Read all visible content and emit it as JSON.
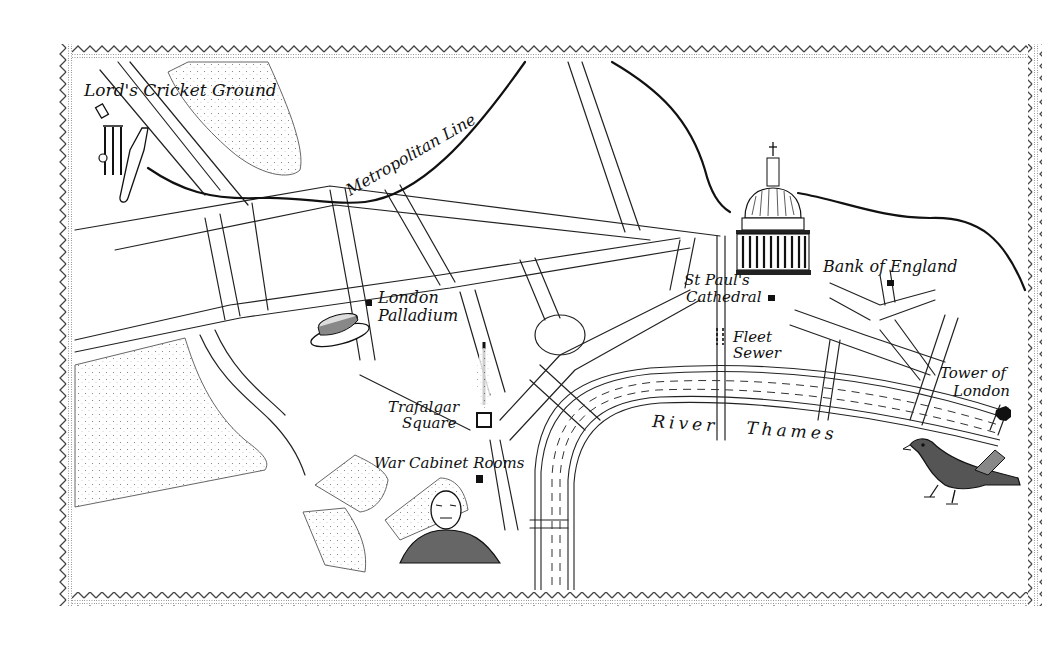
{
  "map": {
    "title": "Central London illustrated map",
    "style": "pen-and-ink hand-drawn",
    "colors": {
      "ink": "#111111",
      "paper": "#ffffff",
      "stipple": "#555555",
      "border": "#444444"
    },
    "border": {
      "pattern": "zigzag-dotted",
      "x": 58,
      "y": 44,
      "width": 984,
      "height": 562
    },
    "labels": {
      "lords": "Lord's Cricket Ground",
      "metropolitan": "Metropolitan Line",
      "stpauls_1": "St Paul's",
      "stpauls_2": "Cathedral",
      "bank": "Bank of England",
      "palladium_1": "London",
      "palladium_2": "Palladium",
      "fleet_1": "Fleet",
      "fleet_2": "Sewer",
      "trafalgar_1": "Trafalgar",
      "trafalgar_2": "Square",
      "war_cabinet": "War Cabinet Rooms",
      "tower_1": "Tower of",
      "tower_2": "London",
      "river": "River   Thames"
    },
    "landmarks": [
      {
        "name": "Lord's Cricket Ground",
        "icon": "cricket-stumps-and-bat-icon",
        "marker": "open-square"
      },
      {
        "name": "London Palladium",
        "icon": "boater-hat-icon",
        "marker": "filled-square"
      },
      {
        "name": "Trafalgar Square",
        "icon": "nelsons-column-icon",
        "marker": "open-square"
      },
      {
        "name": "War Cabinet Rooms",
        "icon": "churchill-portrait-icon",
        "marker": "filled-square"
      },
      {
        "name": "St Paul's Cathedral",
        "icon": "dome-icon",
        "marker": "filled-square"
      },
      {
        "name": "Bank of England",
        "icon": "",
        "marker": "filled-square"
      },
      {
        "name": "Fleet Sewer",
        "icon": "",
        "marker": "dashed-line"
      },
      {
        "name": "Tower of London",
        "icon": "raven-icon",
        "marker": "filled-octagon"
      }
    ],
    "features": [
      {
        "name": "Metropolitan Line",
        "type": "railway"
      },
      {
        "name": "River Thames",
        "type": "river"
      }
    ]
  }
}
